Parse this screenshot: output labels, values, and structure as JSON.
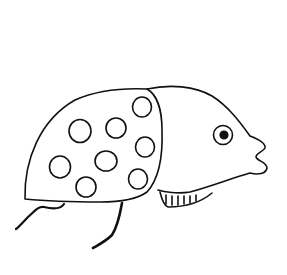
{
  "image": {
    "subject": "line drawing of a spotted creature with a shell body and fish-like head",
    "background_color": "#ffffff",
    "stroke_color": "#111111"
  },
  "figure": {
    "body": {
      "type": "spotted-shell",
      "spot_count": 8
    },
    "head": {
      "type": "fish-head",
      "features": [
        "eye",
        "lips",
        "striped-underside"
      ]
    },
    "legs": {
      "count": 2
    }
  }
}
